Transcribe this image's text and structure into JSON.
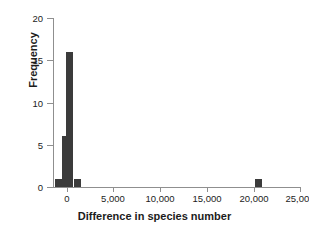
{
  "chart_data": {
    "type": "bar",
    "title": "",
    "subtitle": "",
    "xlabel": "Difference in species number",
    "ylabel": "Frequency",
    "xlim": [
      -1500,
      25000
    ],
    "ylim": [
      0,
      20
    ],
    "xticks": [
      0,
      5000,
      10000,
      15000,
      20000,
      25000
    ],
    "xtick_labels": [
      "0",
      "5,000",
      "10,000",
      "15,000",
      "20,000",
      "25,000"
    ],
    "yticks": [
      0,
      5,
      10,
      15,
      20
    ],
    "ytick_labels": [
      "0",
      "5",
      "10",
      "15",
      "20"
    ],
    "grid": false,
    "legend": "none",
    "bar_color": "#3b3b3b",
    "axis_color": "#8f8f8f",
    "text_color": "#1c1c1c",
    "bin_width": 700,
    "bars": [
      {
        "x": -900,
        "value": 1,
        "label": "bin--900"
      },
      {
        "x": -150,
        "value": 6,
        "label": "bin--150"
      },
      {
        "x": 250,
        "value": 16,
        "label": "bin-250"
      },
      {
        "x": 1100,
        "value": 1,
        "label": "bin-1100"
      },
      {
        "x": 20500,
        "value": 1,
        "label": "bin-20500"
      }
    ],
    "categories": [
      "-900",
      "-150",
      "250",
      "1100",
      "20500"
    ],
    "values": [
      1,
      6,
      16,
      1,
      1
    ]
  }
}
